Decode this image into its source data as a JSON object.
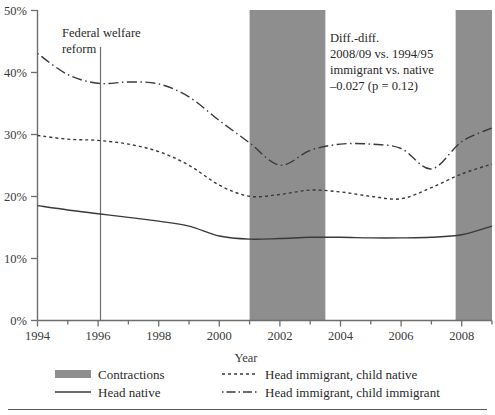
{
  "chart_data": {
    "type": "line",
    "title": "",
    "xlabel": "Year",
    "ylabel": "",
    "xlim": [
      1994,
      2009
    ],
    "ylim": [
      0,
      50
    ],
    "y_unit": "%",
    "grid": false,
    "x_ticks": [
      1994,
      1996,
      1998,
      2000,
      2002,
      2004,
      2006,
      2008
    ],
    "x_tick_labels": [
      "1994",
      "1996",
      "1998",
      "2000",
      "2002",
      "2004",
      "2006",
      "2008"
    ],
    "x_minor_ticks": [
      1995,
      1997,
      1999,
      2001,
      2003,
      2005,
      2007,
      2009
    ],
    "y_ticks": [
      0,
      10,
      20,
      30,
      40,
      50
    ],
    "y_tick_labels": [
      "0%",
      "10%",
      "20%",
      "30%",
      "40%",
      "50%"
    ],
    "x": [
      1994,
      1995,
      1996,
      1997,
      1998,
      1999,
      2000,
      2001,
      2002,
      2003,
      2004,
      2005,
      2006,
      2007,
      2008,
      2009
    ],
    "series": [
      {
        "name": "Head native",
        "style": "solid",
        "color": "#3a3a3a",
        "values": [
          18.5,
          17.8,
          17.2,
          16.6,
          16.0,
          15.2,
          13.6,
          13.1,
          13.2,
          13.4,
          13.4,
          13.3,
          13.3,
          13.4,
          13.8,
          15.2
        ]
      },
      {
        "name": "Head immigrant, child native",
        "style": "dotted",
        "color": "#3a3a3a",
        "values": [
          29.8,
          29.2,
          29.0,
          28.4,
          27.2,
          25.0,
          21.8,
          20.0,
          20.3,
          21.0,
          20.7,
          20.0,
          19.6,
          21.4,
          23.6,
          25.2
        ]
      },
      {
        "name": "Head immigrant, child immigrant",
        "style": "dashdot",
        "color": "#3a3a3a",
        "values": [
          43.0,
          39.6,
          38.2,
          38.4,
          38.1,
          36.0,
          32.2,
          28.6,
          25.0,
          27.4,
          28.4,
          28.4,
          27.7,
          24.4,
          28.8,
          31.0
        ]
      }
    ],
    "shaded_regions": [
      {
        "name": "Contractions",
        "from": 2001.0,
        "to": 2003.5
      },
      {
        "name": "Contractions",
        "from": 2007.8,
        "to": 2009.0
      }
    ],
    "annotations": [
      {
        "name": "federal-welfare-reform",
        "lines": [
          "Federal welfare",
          "reform"
        ],
        "marker_x": 1996,
        "marker_type": "vertical-line"
      },
      {
        "name": "diff-in-diff",
        "lines": [
          "Diff.-diff.",
          "2008/09 vs. 1994/95",
          "immigrant vs. native",
          "–0.027 (p = 0.12)"
        ]
      }
    ],
    "legend": {
      "position": "bottom",
      "entries": [
        {
          "label": "Contractions",
          "marker": "filled-band",
          "style": "band"
        },
        {
          "label": "Head native",
          "marker": "solid-line",
          "style": "solid"
        },
        {
          "label": "Head immigrant, child native",
          "marker": "dotted-line",
          "style": "dotted"
        },
        {
          "label": "Head immigrant, child immigrant",
          "marker": "dashdot-line",
          "style": "dashdot"
        }
      ]
    },
    "colors": {
      "band": "#8e8e8e",
      "line": "#3a3a3a",
      "axis": "#6e6e6e",
      "text": "#2a2a2a",
      "background": "#ffffff"
    }
  }
}
